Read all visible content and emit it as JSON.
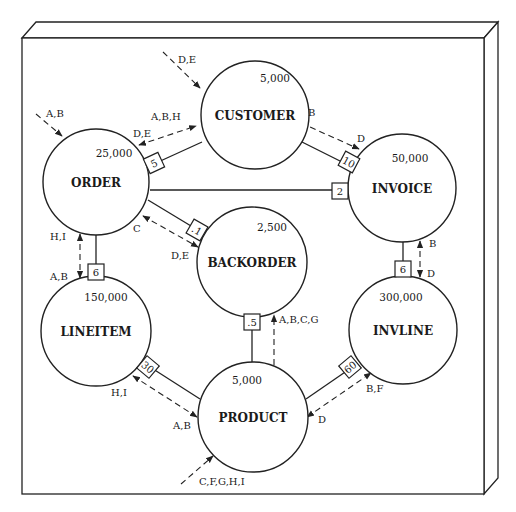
{
  "diagram": {
    "colors": {
      "ink": "#222222",
      "paper": "#ffffff"
    },
    "frame": {
      "front": [
        22,
        38,
        484,
        494
      ],
      "top_bevel": [
        [
          22,
          38
        ],
        [
          36,
          22
        ],
        [
          498,
          22
        ],
        [
          484,
          38
        ]
      ],
      "right_bevel": [
        [
          484,
          38
        ],
        [
          498,
          22
        ],
        [
          498,
          478
        ],
        [
          484,
          494
        ]
      ]
    },
    "entities": [
      {
        "id": "customer",
        "name": "CUSTOMER",
        "count": "5,000",
        "cx": 255,
        "cy": 115,
        "r": 54,
        "count_dx": 20,
        "count_dy": -36
      },
      {
        "id": "order",
        "name": "ORDER",
        "count": "25,000",
        "cx": 96,
        "cy": 182,
        "r": 53,
        "count_dx": 18,
        "count_dy": -28
      },
      {
        "id": "invoice",
        "name": "INVOICE",
        "count": "50,000",
        "cx": 402,
        "cy": 188,
        "r": 54,
        "count_dx": 8,
        "count_dy": -29
      },
      {
        "id": "backorder",
        "name": "BACKORDER",
        "count": "2,500",
        "cx": 252,
        "cy": 262,
        "r": 55,
        "count_dx": 20,
        "count_dy": -34
      },
      {
        "id": "lineitem",
        "name": "LINEITEM",
        "count": "150,000",
        "cx": 96,
        "cy": 331,
        "r": 55,
        "count_dx": 10,
        "count_dy": -33
      },
      {
        "id": "invline",
        "name": "INVLINE",
        "count": "300,000",
        "cx": 403,
        "cy": 330,
        "r": 54,
        "count_dx": -2,
        "count_dy": -32
      },
      {
        "id": "product",
        "name": "PRODUCT",
        "count": "5,000",
        "cx": 253,
        "cy": 417,
        "r": 55,
        "count_dx": -6,
        "count_dy": -36
      }
    ],
    "relationships": [
      {
        "id": "customer-order",
        "from": "customer",
        "to": "order",
        "x1": 202,
        "y1": 142,
        "x2": 156,
        "y2": 163,
        "ratio": "5",
        "bx": 154,
        "by": 163,
        "rot": -25
      },
      {
        "id": "customer-invoice",
        "from": "customer",
        "to": "invoice",
        "x1": 296,
        "y1": 139,
        "x2": 350,
        "y2": 166,
        "ratio": "10",
        "bx": 349,
        "by": 162,
        "rot": 28
      },
      {
        "id": "order-invoice",
        "from": "order",
        "to": "invoice",
        "x1": 150,
        "y1": 190,
        "x2": 339,
        "y2": 190,
        "ratio": "2",
        "bx": 340,
        "by": 191,
        "rot": 0
      },
      {
        "id": "order-backorder",
        "from": "order",
        "to": "backorder",
        "x1": 148,
        "y1": 200,
        "x2": 196,
        "y2": 229,
        "ratio": ".1",
        "bx": 197,
        "by": 230,
        "rot": 30
      },
      {
        "id": "order-lineitem",
        "from": "order",
        "to": "lineitem",
        "x1": 96,
        "y1": 235,
        "x2": 96,
        "y2": 266,
        "ratio": "6",
        "bx": 96,
        "by": 272,
        "rot": 0
      },
      {
        "id": "invoice-invline",
        "from": "invoice",
        "to": "invline",
        "x1": 403,
        "y1": 242,
        "x2": 403,
        "y2": 262,
        "ratio": "6",
        "bx": 403,
        "by": 269,
        "rot": 0
      },
      {
        "id": "backorder-product",
        "from": "backorder",
        "to": "product",
        "x1": 252,
        "y1": 317,
        "x2": 252,
        "y2": 362,
        "ratio": ".5",
        "bx": 252,
        "by": 322,
        "rot": 0
      },
      {
        "id": "lineitem-product",
        "from": "lineitem",
        "to": "product",
        "x1": 150,
        "y1": 367,
        "x2": 200,
        "y2": 399,
        "ratio": "30",
        "bx": 148,
        "by": 367,
        "rot": 40
      },
      {
        "id": "invline-product",
        "from": "invline",
        "to": "product",
        "x1": 306,
        "y1": 399,
        "x2": 351,
        "y2": 368,
        "ratio": "60",
        "bx": 350,
        "by": 367,
        "rot": -40
      }
    ],
    "access_paths": [
      {
        "id": "entry-customer",
        "x1": 163,
        "y1": 52,
        "x2": 200,
        "y2": 88,
        "arrow_start": false,
        "arrow_end": true
      },
      {
        "id": "entry-order",
        "x1": 36,
        "y1": 114,
        "x2": 62,
        "y2": 136,
        "arrow_start": false,
        "arrow_end": true
      },
      {
        "id": "order-customer-access",
        "x1": 139,
        "y1": 145,
        "x2": 196,
        "y2": 126,
        "arrow_start": true,
        "arrow_end": true
      },
      {
        "id": "customer-invoice-access",
        "x1": 301,
        "y1": 123,
        "x2": 359,
        "y2": 149,
        "arrow_start": true,
        "arrow_end": true
      },
      {
        "id": "order-backorder-access",
        "x1": 143,
        "y1": 216,
        "x2": 198,
        "y2": 247,
        "arrow_start": true,
        "arrow_end": true
      },
      {
        "id": "order-lineitem-access",
        "x1": 80,
        "y1": 234,
        "x2": 80,
        "y2": 278,
        "arrow_start": true,
        "arrow_end": true
      },
      {
        "id": "invoice-invline-access",
        "x1": 420,
        "y1": 241,
        "x2": 420,
        "y2": 277,
        "arrow_start": true,
        "arrow_end": true
      },
      {
        "id": "product-backorder-access",
        "x1": 274,
        "y1": 365,
        "x2": 274,
        "y2": 315,
        "arrow_start": false,
        "arrow_end": true
      },
      {
        "id": "lineitem-product-access",
        "x1": 133,
        "y1": 376,
        "x2": 197,
        "y2": 417,
        "arrow_start": true,
        "arrow_end": true
      },
      {
        "id": "invline-product-access",
        "x1": 307,
        "y1": 417,
        "x2": 371,
        "y2": 373,
        "arrow_start": true,
        "arrow_end": true
      },
      {
        "id": "entry-product",
        "x1": 181,
        "y1": 484,
        "x2": 213,
        "y2": 456,
        "arrow_start": false,
        "arrow_end": true
      }
    ],
    "access_labels": [
      {
        "text": "D,E",
        "x": 178,
        "y": 60
      },
      {
        "text": "A,B",
        "x": 46,
        "y": 114
      },
      {
        "text": "A,B,H",
        "x": 151,
        "y": 117
      },
      {
        "text": "D,E",
        "x": 133,
        "y": 134
      },
      {
        "text": "B",
        "x": 308,
        "y": 113
      },
      {
        "text": "D",
        "x": 357,
        "y": 139
      },
      {
        "text": "C",
        "x": 133,
        "y": 229
      },
      {
        "text": "D,E",
        "x": 171,
        "y": 256
      },
      {
        "text": "H,I",
        "x": 50,
        "y": 237
      },
      {
        "text": "A,B",
        "x": 50,
        "y": 277
      },
      {
        "text": "B",
        "x": 429,
        "y": 244
      },
      {
        "text": "D",
        "x": 427,
        "y": 274
      },
      {
        "text": "A,B,C,G",
        "x": 279,
        "y": 320
      },
      {
        "text": "H,I",
        "x": 111,
        "y": 393
      },
      {
        "text": "A,B",
        "x": 173,
        "y": 426
      },
      {
        "text": "B,F",
        "x": 366,
        "y": 389
      },
      {
        "text": "D",
        "x": 318,
        "y": 420
      },
      {
        "text": "C,F,G,H,I",
        "x": 199,
        "y": 482
      }
    ]
  }
}
